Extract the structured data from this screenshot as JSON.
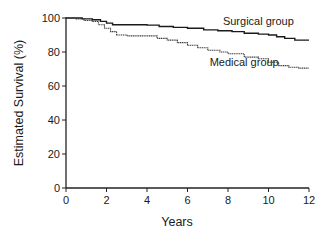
{
  "chart_data": {
    "type": "line",
    "subtype": "kaplan-meier step",
    "title": "",
    "xlabel": "Years",
    "ylabel": "Estimated Survival (%)",
    "xlim": [
      0,
      12
    ],
    "ylim": [
      0,
      100
    ],
    "x_ticks": [
      0,
      2,
      4,
      6,
      8,
      10,
      12
    ],
    "y_ticks": [
      0,
      20,
      40,
      60,
      80,
      100
    ],
    "grid": false,
    "legend_position": "inline labels near curves",
    "series": [
      {
        "name": "Surgical group",
        "style": "solid",
        "color": "#1a1a1a",
        "points": [
          [
            0,
            100
          ],
          [
            0.8,
            99.5
          ],
          [
            1.3,
            99
          ],
          [
            1.7,
            98
          ],
          [
            2.0,
            97
          ],
          [
            2.3,
            96
          ],
          [
            3.0,
            96
          ],
          [
            4.0,
            95.8
          ],
          [
            4.6,
            95
          ],
          [
            5.3,
            94.5
          ],
          [
            6.0,
            94
          ],
          [
            6.8,
            93
          ],
          [
            7.5,
            92.5
          ],
          [
            8.2,
            92
          ],
          [
            8.8,
            91
          ],
          [
            9.5,
            90.5
          ],
          [
            10.0,
            90
          ],
          [
            10.4,
            89
          ],
          [
            10.8,
            88
          ],
          [
            11.3,
            87
          ],
          [
            12.0,
            87
          ]
        ]
      },
      {
        "name": "Medical group",
        "style": "dotted",
        "color": "#3a3a3a",
        "points": [
          [
            0,
            100
          ],
          [
            0.5,
            99.5
          ],
          [
            0.9,
            98.5
          ],
          [
            1.3,
            98
          ],
          [
            1.6,
            96
          ],
          [
            1.9,
            94
          ],
          [
            2.2,
            92
          ],
          [
            2.5,
            90
          ],
          [
            3.0,
            89.5
          ],
          [
            4.0,
            89.5
          ],
          [
            4.5,
            88
          ],
          [
            5.0,
            87
          ],
          [
            5.5,
            85.5
          ],
          [
            6.0,
            84
          ],
          [
            6.5,
            82.5
          ],
          [
            7.0,
            81
          ],
          [
            7.6,
            80
          ],
          [
            8.0,
            79
          ],
          [
            8.8,
            77
          ],
          [
            9.5,
            76
          ],
          [
            10.0,
            74
          ],
          [
            10.5,
            72
          ],
          [
            11.0,
            71
          ],
          [
            11.5,
            70.5
          ],
          [
            12.0,
            70.5
          ]
        ]
      }
    ],
    "annotations": [
      {
        "text": "Surgical group",
        "x": 9.5,
        "y": 96
      },
      {
        "text": "Medical group",
        "x": 8.8,
        "y": 72
      }
    ]
  }
}
